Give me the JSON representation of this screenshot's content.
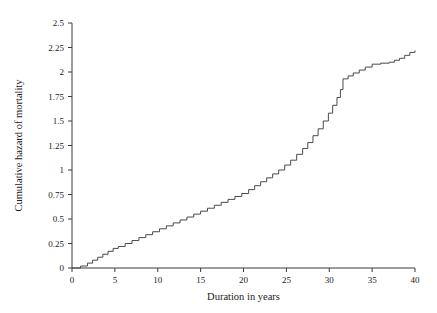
{
  "chart_data": {
    "type": "line",
    "subtype": "step",
    "title": "",
    "xlabel": "Duration in years",
    "ylabel": "Cumulative hazard of mortality",
    "xlim": [
      0,
      40
    ],
    "ylim": [
      0,
      2.5
    ],
    "grid": false,
    "legend": null,
    "xticks": [
      0,
      5,
      10,
      15,
      20,
      25,
      30,
      35,
      40
    ],
    "xtick_labels": [
      "0",
      "5",
      "10",
      "15",
      "20",
      "25",
      "30",
      "35",
      "40"
    ],
    "yticks": [
      0,
      0.25,
      0.5,
      0.75,
      1,
      1.25,
      1.5,
      1.75,
      2,
      2.25,
      2.5
    ],
    "ytick_labels": [
      "0",
      "0.25",
      "0.5",
      "0.75",
      "1",
      "1.25",
      "1.5",
      "1.75",
      "2",
      "2.25",
      "2.5"
    ],
    "line_color": "#4a4a4a",
    "axis_color": "#3a3a3a",
    "background_color": "#ffffff",
    "series": [
      {
        "name": "Cumulative hazard of mortality",
        "step": "post",
        "x": [
          0,
          1.0,
          1.8,
          2.4,
          3.0,
          3.6,
          4.2,
          4.8,
          5.4,
          6.2,
          7.0,
          7.8,
          8.6,
          9.4,
          10.2,
          11.0,
          11.8,
          12.6,
          13.4,
          14.2,
          15.0,
          15.8,
          16.6,
          17.4,
          18.2,
          19.0,
          19.8,
          20.6,
          21.3,
          22.0,
          22.7,
          23.4,
          24.1,
          24.8,
          25.5,
          26.2,
          26.9,
          27.5,
          28.1,
          28.7,
          29.3,
          29.9,
          30.4,
          30.9,
          31.3,
          31.6,
          32.2,
          32.8,
          33.5,
          34.2,
          35.0,
          36.0,
          37.0,
          37.6,
          38.2,
          38.8,
          39.4,
          40.0
        ],
        "y": [
          0,
          0.02,
          0.05,
          0.08,
          0.11,
          0.14,
          0.17,
          0.2,
          0.22,
          0.25,
          0.28,
          0.31,
          0.34,
          0.37,
          0.4,
          0.43,
          0.46,
          0.49,
          0.52,
          0.55,
          0.58,
          0.61,
          0.64,
          0.67,
          0.7,
          0.73,
          0.76,
          0.8,
          0.84,
          0.88,
          0.92,
          0.96,
          1.0,
          1.05,
          1.1,
          1.16,
          1.22,
          1.28,
          1.35,
          1.42,
          1.5,
          1.58,
          1.66,
          1.74,
          1.82,
          1.93,
          1.96,
          1.99,
          2.02,
          2.05,
          2.08,
          2.09,
          2.1,
          2.12,
          2.14,
          2.17,
          2.2,
          2.22
        ]
      }
    ]
  }
}
